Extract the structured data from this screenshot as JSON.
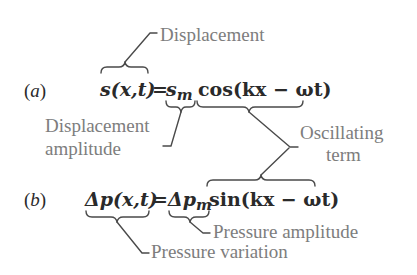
{
  "equations": {
    "a": {
      "tag_open": "(",
      "tag_letter": "a",
      "tag_close": ")",
      "lhs": "s(x,t)",
      "equals": "=",
      "amplitude_base": "s",
      "amplitude_sub": "m",
      "term": "cos(kx − ωt)"
    },
    "b": {
      "tag_open": "(",
      "tag_letter": "b",
      "tag_close": ")",
      "lhs": "Δp(x,t)",
      "equals": "=",
      "amplitude_base": "Δp",
      "amplitude_sub": "m",
      "term": "sin(kx − ωt)"
    }
  },
  "labels": {
    "displacement": "Displacement",
    "displacement_amplitude_line1": "Displacement",
    "displacement_amplitude_line2": "amplitude",
    "oscillating_line1": "Oscillating",
    "oscillating_line2": "term",
    "pressure_amplitude": "Pressure amplitude",
    "pressure_variation": "Pressure variation"
  },
  "colors": {
    "equation_text": "#2a2a2a",
    "label_text": "#7d7d7d",
    "leader_lines": "#4a4a4a",
    "background": "#ffffff"
  }
}
